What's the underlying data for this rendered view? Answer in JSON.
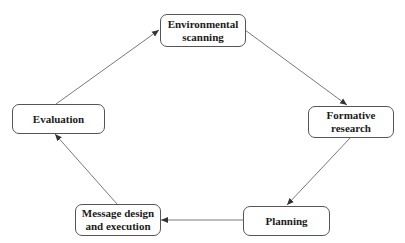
{
  "diagram": {
    "type": "cycle",
    "nodes": [
      {
        "id": "environmental",
        "label": "Environmental\nscanning",
        "line1": "Environmental",
        "line2": "scanning"
      },
      {
        "id": "formative",
        "label": "Formative\nresearch",
        "line1": "Formative",
        "line2": "research"
      },
      {
        "id": "planning",
        "label": "Planning",
        "line1": "Planning"
      },
      {
        "id": "message",
        "label": "Message design\nand execution",
        "line1": "Message design",
        "line2": "and execution"
      },
      {
        "id": "evaluation",
        "label": "Evaluation",
        "line1": "Evaluation"
      }
    ],
    "edges": [
      {
        "from": "environmental",
        "to": "formative"
      },
      {
        "from": "formative",
        "to": "planning"
      },
      {
        "from": "planning",
        "to": "message"
      },
      {
        "from": "message",
        "to": "evaluation"
      },
      {
        "from": "evaluation",
        "to": "environmental"
      }
    ],
    "colors": {
      "stroke": "#555555",
      "text": "#1a1a1a",
      "background": "#ffffff"
    }
  }
}
